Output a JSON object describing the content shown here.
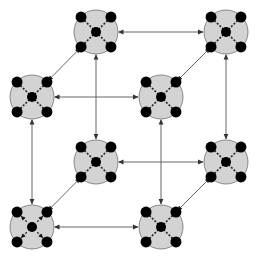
{
  "diagram": {
    "type": "cube-network",
    "canvas": {
      "width": 257,
      "height": 258
    },
    "colors": {
      "background": "#ffffff",
      "node_fill": "#d3d3d3",
      "node_stroke": "#6e6e6e",
      "dot": "#000000",
      "edge": "#555555",
      "inner_link": "#222222"
    },
    "node_radius": 22,
    "dot_radius": 5.5,
    "center_dot_radius": 5,
    "nodes": [
      {
        "id": "back-top-left",
        "x": 96,
        "y": 32,
        "style": "dashed-links"
      },
      {
        "id": "back-top-right",
        "x": 226,
        "y": 32,
        "style": "dashed-links"
      },
      {
        "id": "front-top-left",
        "x": 32,
        "y": 97,
        "style": "dashed-links"
      },
      {
        "id": "front-top-right",
        "x": 161,
        "y": 97,
        "style": "dashed-links"
      },
      {
        "id": "back-bottom-left",
        "x": 96,
        "y": 162,
        "style": "dashed-links"
      },
      {
        "id": "back-bottom-right",
        "x": 226,
        "y": 162,
        "style": "dashed-links"
      },
      {
        "id": "front-bottom-left",
        "x": 32,
        "y": 227,
        "style": "radial-arrows"
      },
      {
        "id": "front-bottom-right",
        "x": 161,
        "y": 227,
        "style": "dashed-links"
      }
    ],
    "edges": [
      {
        "from": "back-top-left",
        "to": "back-top-right",
        "direction": "both"
      },
      {
        "from": "front-top-left",
        "to": "front-top-right",
        "direction": "both"
      },
      {
        "from": "back-bottom-left",
        "to": "back-bottom-right",
        "direction": "both"
      },
      {
        "from": "front-bottom-left",
        "to": "front-bottom-right",
        "direction": "both"
      },
      {
        "from": "back-top-left",
        "to": "back-bottom-left",
        "direction": "both"
      },
      {
        "from": "back-top-right",
        "to": "back-bottom-right",
        "direction": "both"
      },
      {
        "from": "front-top-left",
        "to": "front-bottom-left",
        "direction": "both"
      },
      {
        "from": "front-top-right",
        "to": "front-bottom-right",
        "direction": "both"
      },
      {
        "from": "back-top-left",
        "to": "front-top-left",
        "direction": "both"
      },
      {
        "from": "back-top-right",
        "to": "front-top-right",
        "direction": "both"
      },
      {
        "from": "back-bottom-left",
        "to": "front-bottom-left",
        "direction": "both"
      },
      {
        "from": "back-bottom-right",
        "to": "front-bottom-right",
        "direction": "both"
      }
    ]
  }
}
